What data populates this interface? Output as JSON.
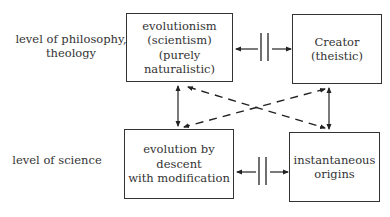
{
  "levels": {
    "philosophy": [
      "level of philosophy,",
      "theology"
    ],
    "science": [
      "level of science"
    ]
  },
  "boxes": {
    "evolutionism": [
      "evolutionism",
      "(scientism)",
      "(purely naturalistic)"
    ],
    "creator": [
      "Creator",
      "(theistic)"
    ],
    "evolution_descent": [
      "evolution by descent",
      "with modification"
    ],
    "instantaneous": [
      "instantaneous",
      "origins"
    ]
  },
  "relations": {
    "top_horizontal": "incompatible (blocked double arrow)",
    "bottom_horizontal": "incompatible (blocked double arrow)",
    "left_vertical": "linked",
    "right_vertical": "linked",
    "diagonals": "dashed cross links"
  }
}
